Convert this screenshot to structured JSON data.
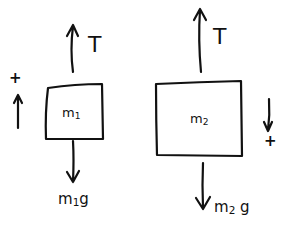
{
  "diagram": {
    "ink_color": "#111111",
    "background": "#ffffff",
    "bodies": [
      {
        "id": "m1",
        "label": "m",
        "label_sub": "1",
        "box": {
          "x": 45,
          "y": 84,
          "w": 59,
          "h": 56
        },
        "forces": [
          {
            "name": "tension",
            "label": "T",
            "direction": "up"
          },
          {
            "name": "weight",
            "label": "m",
            "label_sub": "1",
            "label_suffix": "g",
            "direction": "down"
          }
        ],
        "positive_direction": {
          "symbol": "+",
          "direction": "up"
        }
      },
      {
        "id": "m2",
        "label": "m",
        "label_sub": "2",
        "box": {
          "x": 156,
          "y": 82,
          "w": 86,
          "h": 75
        },
        "forces": [
          {
            "name": "tension",
            "label": "T",
            "direction": "up"
          },
          {
            "name": "weight",
            "label": "m",
            "label_sub": "2",
            "label_suffix": "g",
            "direction": "down"
          }
        ],
        "positive_direction": {
          "symbol": "+",
          "direction": "down"
        }
      }
    ]
  }
}
